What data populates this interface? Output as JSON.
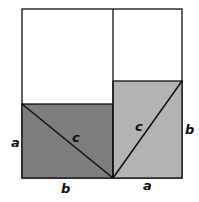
{
  "diagram": {
    "labels": {
      "left_side": "a",
      "left_hyp": "c",
      "left_bottom": "b",
      "right_hyp": "c",
      "right_side": "b",
      "right_bottom": "a"
    },
    "colors": {
      "dark_fill": "#7d7d7d",
      "light_fill": "#b3b3b3",
      "stroke": "#111111",
      "background": "#ffffff"
    }
  }
}
